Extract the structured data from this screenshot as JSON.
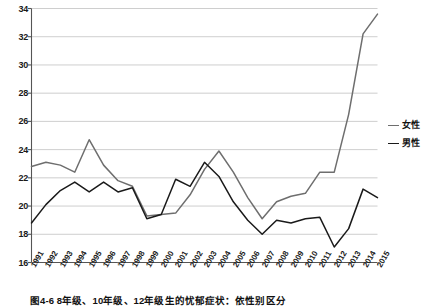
{
  "caption": "图4-6  8年级、10年级、12年级生的忧郁症状：依性别区分",
  "legend": {
    "position": "right",
    "items": [
      {
        "label": "女性",
        "color": "#6e6e6e",
        "icon": "line-swatch-icon"
      },
      {
        "label": "男性",
        "color": "#1a1a1a",
        "icon": "line-swatch-icon"
      }
    ]
  },
  "axis": {
    "y_ticks": [
      "16",
      "18",
      "20",
      "22",
      "24",
      "26",
      "28",
      "30",
      "32",
      "34"
    ],
    "x_ticks": [
      "1991",
      "1992",
      "1993",
      "1994",
      "1995",
      "1996",
      "1997",
      "1998",
      "1999",
      "2000",
      "2001",
      "2002",
      "2003",
      "2004",
      "2005",
      "2006",
      "2007",
      "2008",
      "2009",
      "2010",
      "2011",
      "2012",
      "2013",
      "2014",
      "2015"
    ]
  },
  "colors": {
    "female_line": "#6e6e6e",
    "male_line": "#1a1a1a",
    "gridline": "#c8c8c8",
    "axis": "#555555",
    "background": "#ffffff"
  },
  "chart_data": {
    "type": "line",
    "title": "图4-6  8年级、10年级、12年级生的忧郁症状：依性别区分",
    "xlabel": "",
    "ylabel": "",
    "ylim": [
      16,
      34
    ],
    "ytick_step": 2,
    "grid": true,
    "legend_position": "right",
    "x": [
      "1991",
      "1992",
      "1993",
      "1994",
      "1995",
      "1996",
      "1997",
      "1998",
      "1999",
      "2000",
      "2001",
      "2002",
      "2003",
      "2004",
      "2005",
      "2006",
      "2007",
      "2008",
      "2009",
      "2010",
      "2011",
      "2012",
      "2013",
      "2014",
      "2015"
    ],
    "series": [
      {
        "name": "女性",
        "color": "#6e6e6e",
        "values": [
          22.8,
          23.1,
          22.9,
          22.4,
          24.7,
          22.9,
          21.8,
          21.4,
          19.3,
          19.4,
          19.5,
          20.8,
          22.6,
          23.9,
          22.4,
          20.6,
          19.1,
          20.3,
          20.7,
          20.9,
          22.4,
          22.4,
          26.5,
          32.2,
          33.6
        ]
      },
      {
        "name": "男性",
        "color": "#1a1a1a",
        "values": [
          18.8,
          20.1,
          21.1,
          21.7,
          21.0,
          21.7,
          21.0,
          21.3,
          19.1,
          19.4,
          21.9,
          21.4,
          23.1,
          22.1,
          20.3,
          19.0,
          18.0,
          19.0,
          18.8,
          19.1,
          19.2,
          17.1,
          18.4,
          21.2,
          20.6
        ]
      }
    ]
  }
}
